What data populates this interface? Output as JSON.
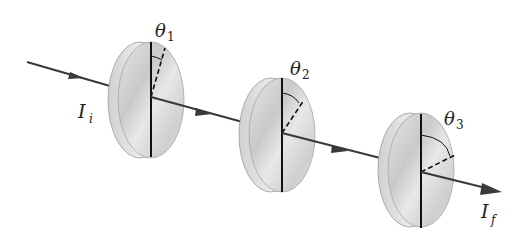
{
  "diagram": {
    "labels": {
      "input_intensity": {
        "symbol": "I",
        "subscript": "i"
      },
      "output_intensity": {
        "symbol": "I",
        "subscript": "f"
      },
      "angles": [
        {
          "symbol": "θ",
          "subscript": "1"
        },
        {
          "symbol": "θ",
          "subscript": "2"
        },
        {
          "symbol": "θ",
          "subscript": "3"
        }
      ]
    },
    "colors": {
      "beam": "#3a3a3a",
      "disc_face": "#d4d4d4",
      "disc_edge": "#bdbdbd",
      "axis_line": "#111111"
    }
  }
}
